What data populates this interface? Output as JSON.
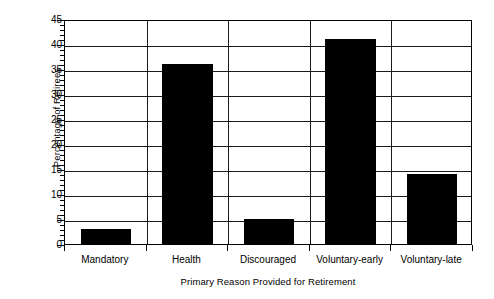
{
  "chart_data": {
    "type": "bar",
    "title": "",
    "xlabel": "Primary Reason Provided for Retirement",
    "ylabel": "Percentage of Retirees",
    "categories": [
      "Mandatory",
      "Health",
      "Discouraged",
      "Voluntary-early",
      "Voluntary-late"
    ],
    "values": [
      3,
      36,
      5,
      41,
      14
    ],
    "ylim": [
      0,
      45
    ],
    "ytick_labels": [
      "0",
      "5",
      "10",
      "15",
      "20",
      "25",
      "30",
      "35",
      "40",
      "45"
    ],
    "ytick_values": [
      0,
      5,
      10,
      15,
      20,
      25,
      30,
      35,
      40,
      45
    ],
    "minor_tick_step": 1,
    "grid": "horizontal-and-vertical",
    "legend": "none",
    "bar_color": "#000000",
    "background_color": "#ffffff",
    "axis_color": "#000000"
  }
}
